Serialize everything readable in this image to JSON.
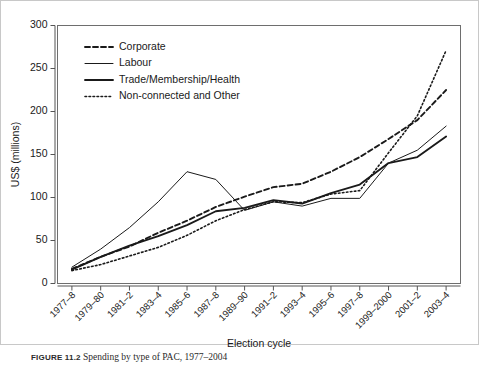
{
  "figure": {
    "caption_label": "FIGURE 11.2",
    "caption_text": "Spending by type of PAC, 1977–2004"
  },
  "chart_data": {
    "type": "line",
    "title": "",
    "xlabel": "Election cycle",
    "ylabel": "US$ (millions)",
    "ylim": [
      0,
      300
    ],
    "yticks": [
      0,
      50,
      100,
      150,
      200,
      250,
      300
    ],
    "ytick_labels": [
      "0",
      "50",
      "100",
      "150",
      "200",
      "250",
      "300"
    ],
    "grid": false,
    "legend_position": "upper-left",
    "categories": [
      "1977–8",
      "1979–80",
      "1981–2",
      "1983–4",
      "1985–6",
      "1987–8",
      "1989–90",
      "1991–2",
      "1993–4",
      "1995–6",
      "1997–8",
      "1999–2000",
      "2001–2",
      "2003–4"
    ],
    "series": [
      {
        "name": "Corporate",
        "style": "dashed",
        "values": [
          17,
          31,
          43,
          59,
          73,
          89,
          101,
          112,
          116,
          130,
          147,
          168,
          190,
          225
        ]
      },
      {
        "name": "Labour",
        "style": "thin-solid",
        "values": [
          19,
          40,
          65,
          95,
          130,
          121,
          85,
          95,
          90,
          99,
          99,
          140,
          155,
          183
        ]
      },
      {
        "name": "Trade/Membership/Health",
        "style": "thick-solid",
        "values": [
          16,
          31,
          44,
          55,
          68,
          84,
          88,
          97,
          93,
          105,
          115,
          140,
          147,
          171
        ]
      },
      {
        "name": "Non-connected and Other",
        "style": "dotted",
        "values": [
          15,
          22,
          32,
          42,
          56,
          73,
          86,
          95,
          94,
          104,
          108,
          152,
          195,
          271
        ]
      }
    ]
  }
}
